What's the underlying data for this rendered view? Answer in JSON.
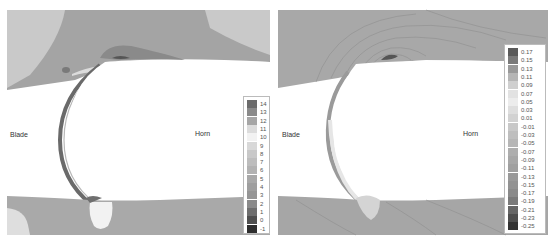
{
  "figure": {
    "panels": [
      {
        "id": "left",
        "labels": {
          "blade": "Blade",
          "horn": "Horn"
        },
        "legend": {
          "values": [
            "14",
            "13",
            "12",
            "11",
            "10",
            "9",
            "8",
            "7",
            "6",
            "5",
            "4",
            "3",
            "2",
            "1",
            "0",
            "-1"
          ],
          "colors": [
            "#6b6b6b",
            "#8a8a8a",
            "#a6a6a6",
            "#dcdcdc",
            "#f2f2f2",
            "#d8d8d8",
            "#c8c8c8",
            "#bdbdbd",
            "#b2b2b2",
            "#a8a8a8",
            "#9e9e9e",
            "#959595",
            "#8a8a8a",
            "#6e6e6e",
            "#4f4f4f",
            "#2e2e2e"
          ]
        }
      },
      {
        "id": "right",
        "labels": {
          "blade": "Blade",
          "horn": "Horn"
        },
        "legend": {
          "values": [
            "0.17",
            "0.15",
            "0.13",
            "0.11",
            "0.09",
            "0.07",
            "0.05",
            "0.03",
            "0.01",
            "-0.01",
            "-0.03",
            "-0.05",
            "-0.07",
            "-0.09",
            "-0.11",
            "-0.13",
            "-0.15",
            "-0.17",
            "-0.19",
            "-0.21",
            "-0.23",
            "-0.25"
          ],
          "colors": [
            "#5a5a5a",
            "#7a7a7a",
            "#999999",
            "#b5b5b5",
            "#cfcfcf",
            "#e2e2e2",
            "#ececec",
            "#dedede",
            "#d2d2d2",
            "#c8c8c8",
            "#bebebe",
            "#b6b6b6",
            "#aeaeae",
            "#a7a7a7",
            "#a0a0a0",
            "#999999",
            "#929292",
            "#8a8a8a",
            "#7a7a7a",
            "#666666",
            "#4e4e4e",
            "#333333"
          ]
        }
      }
    ]
  }
}
